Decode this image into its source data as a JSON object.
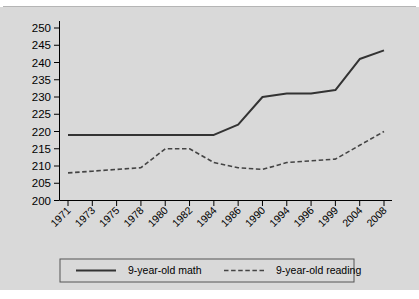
{
  "chart_data": {
    "type": "line",
    "title": "",
    "subtitle": "",
    "xlabel": "",
    "ylabel": "",
    "ylim": [
      200,
      250
    ],
    "ytick_step": 5,
    "yticks": [
      "200",
      "205",
      "210",
      "215",
      "220",
      "225",
      "230",
      "235",
      "240",
      "245",
      "250"
    ],
    "categories": [
      "1971",
      "1973",
      "1975",
      "1978",
      "1980",
      "1982",
      "1984",
      "1986",
      "1990",
      "1994",
      "1996",
      "1999",
      "2004",
      "2008"
    ],
    "grid": false,
    "legend_position": "bottom",
    "series": [
      {
        "name": "9-year-old math",
        "style": "solid",
        "color": "#333333",
        "values": [
          219,
          219,
          219,
          219,
          219,
          219,
          219,
          222,
          230,
          231,
          231,
          232,
          241,
          243.5
        ]
      },
      {
        "name": "9-year-old reading",
        "style": "dashed",
        "color": "#444444",
        "values": [
          208,
          208.5,
          209,
          209.5,
          215,
          215,
          211,
          209.5,
          209,
          211,
          211.5,
          212,
          216,
          220
        ]
      }
    ]
  },
  "legend": {
    "items": [
      {
        "label": "9-year-old math",
        "style": "solid"
      },
      {
        "label": "9-year-old reading",
        "style": "dashed"
      }
    ]
  },
  "colors": {
    "background": "#d9d9d9",
    "plot_background": "#d9d9d9",
    "axis": "#000000",
    "math_line": "#333333",
    "reading_line": "#444444",
    "page_border": "#ffffff"
  }
}
